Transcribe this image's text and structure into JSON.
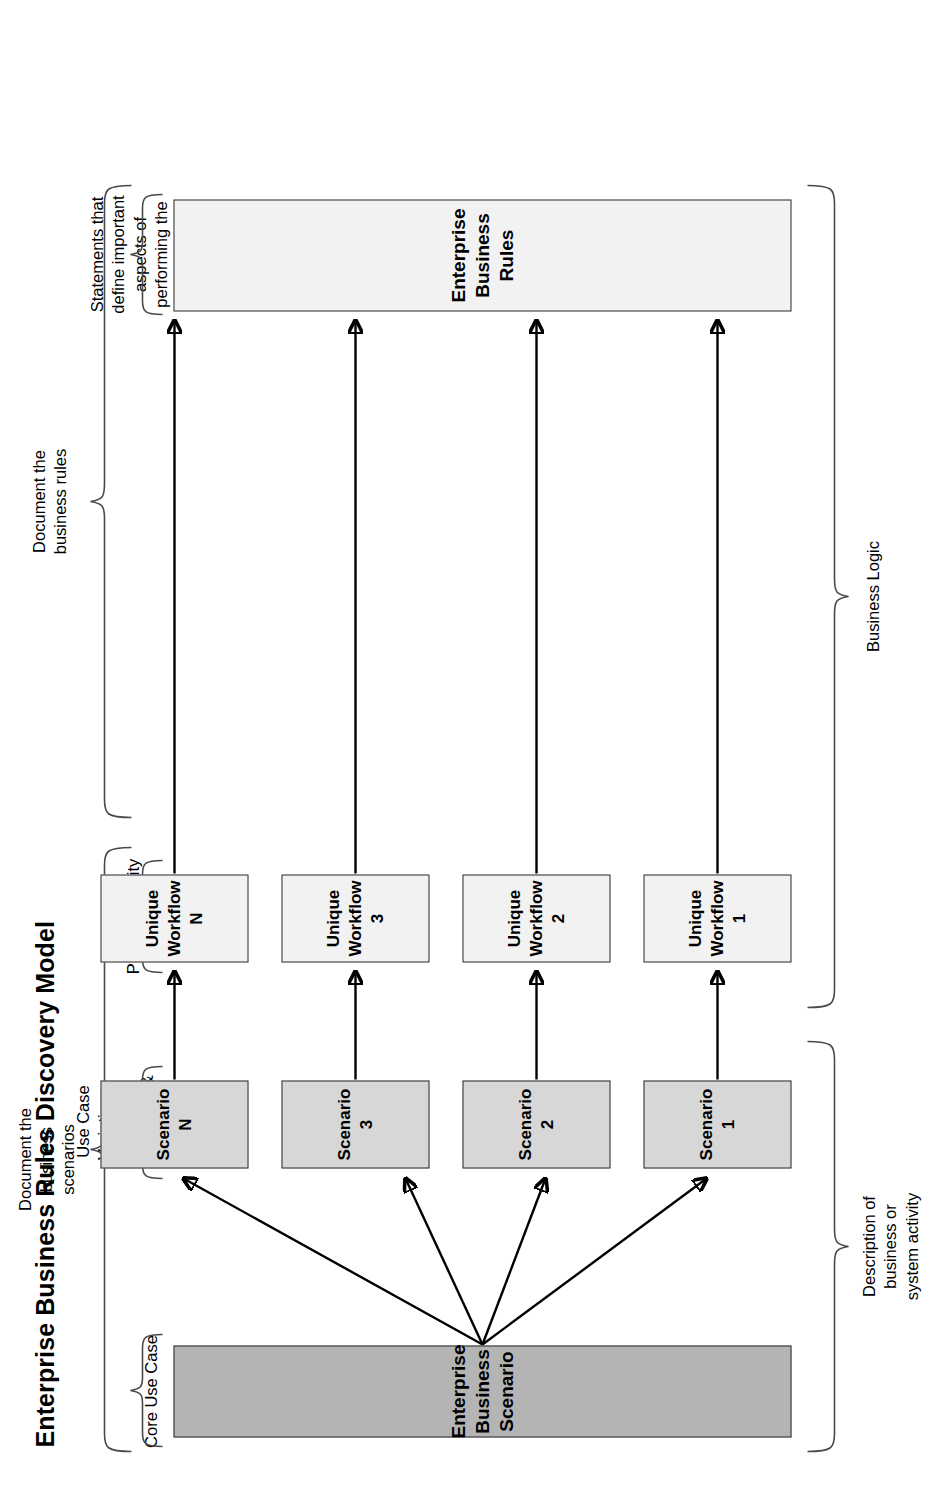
{
  "title": "Enterprise Business Rules Discovery Model",
  "top_annotations": [
    {
      "id": "document-business-scenarios",
      "text": "Document the\nbusiness\nscenarios"
    },
    {
      "id": "document-business-rules",
      "text": "Document the\nbusiness rules"
    }
  ],
  "column_labels": [
    {
      "id": "core-use-case",
      "text": "Core Use Case"
    },
    {
      "id": "use-case-variations",
      "text": "Use Case\nVariations:\nAlternate\nProcesses &\nException\nHandling"
    },
    {
      "id": "process-activity-steps",
      "text": "Process Activity\nSteps"
    },
    {
      "id": "statements-business",
      "text": "Statements that\ndefine important\naspects of\nperforming the\nbusiness"
    }
  ],
  "bottom_annotations": [
    {
      "id": "description-of-activity",
      "text": "Description of\nbusiness or\nsystem activity"
    },
    {
      "id": "business-logic",
      "text": "Business Logic"
    }
  ],
  "boxes": {
    "source": {
      "label": "Enterprise Business Scenario",
      "fill": "#b4b4b4"
    },
    "target": {
      "label": "Enterprise Business Rules",
      "fill": "#f2f2f2"
    },
    "scenarios": [
      {
        "label": "Scenario 1",
        "fill": "#d7d7d7"
      },
      {
        "label": "Scenario 2",
        "fill": "#d7d7d7"
      },
      {
        "label": "Scenario 3",
        "fill": "#d7d7d7"
      },
      {
        "label": "Scenario N",
        "fill": "#d7d7d7"
      }
    ],
    "workflows": [
      {
        "label": "Unique\nWorkflow 1",
        "fill": "#f2f2f2"
      },
      {
        "label": "Unique\nWorkflow 2",
        "fill": "#f2f2f2"
      },
      {
        "label": "Unique\nWorkflow 3",
        "fill": "#f2f2f2"
      },
      {
        "label": "Unique\nWorkflow N",
        "fill": "#f2f2f2"
      }
    ]
  },
  "colors": {
    "box_border": "#2b2b2b",
    "brace_stroke": "#4a4a4a",
    "arrow": "#000000",
    "page_background": "#ffffff"
  }
}
